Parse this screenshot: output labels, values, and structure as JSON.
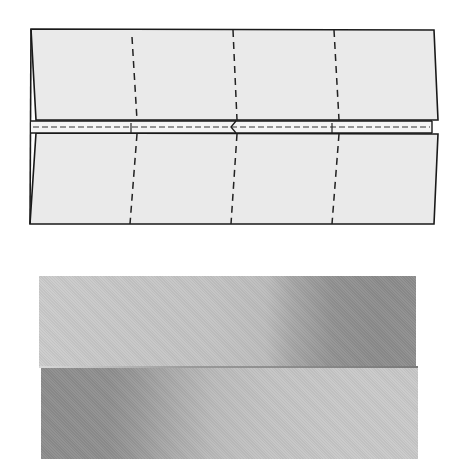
{
  "figure": {
    "type": "origami folding diagram",
    "diagram": {
      "description": "Paper folded with both long edges meeting at the center; three vertical valley-fold dashed lines divide it into four sections; a small horizontal dashed band marks the central gap",
      "paper_fill": "#eaeaea",
      "outline_color": "#1a1a1a",
      "dash_color": "#222222",
      "vertical_fold_lines": 3,
      "sections": 4,
      "center_gap_marker": "small hinge/arrow mark at the middle crease"
    },
    "photo": {
      "description": "Photograph of the folded paper strip: upper flap darkens toward the right, lower flap darkens toward the left",
      "top_strip_shading": "light-left to dark-right",
      "bottom_strip_shading": "dark-left to light-right"
    }
  }
}
